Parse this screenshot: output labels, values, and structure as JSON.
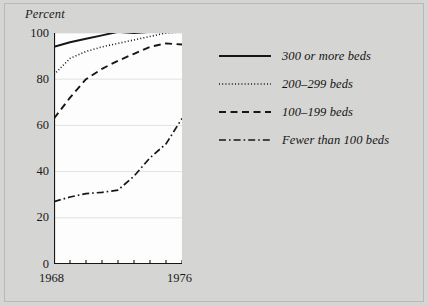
{
  "chart_data": {
    "type": "line",
    "title": "",
    "xlabel": "",
    "ylabel": "Percent",
    "xlim": [
      1968,
      1976
    ],
    "ylim": [
      0,
      100
    ],
    "grid": true,
    "legend_position": "right",
    "x": [
      1968,
      1969,
      1970,
      1971,
      1972,
      1973,
      1974,
      1975,
      1976
    ],
    "xtick_labels": [
      "1968",
      "1976"
    ],
    "ytick_labels": [
      "0",
      "20",
      "40",
      "60",
      "80",
      "100"
    ],
    "yticks": [
      0,
      20,
      40,
      60,
      80,
      100
    ],
    "series": [
      {
        "name": "300 or more beds",
        "style": "solid",
        "values": [
          94,
          96,
          97.5,
          99,
          100.5,
          100,
          100.5,
          101,
          101
        ]
      },
      {
        "name": "200-299 beds",
        "style": "dotted",
        "values": [
          82,
          89,
          92,
          94,
          95.5,
          97,
          98.5,
          100,
          100.5
        ]
      },
      {
        "name": "100-199 beds",
        "style": "dashed",
        "values": [
          63,
          72,
          80,
          84.5,
          88,
          91,
          94,
          95.5,
          95
        ]
      },
      {
        "name": "Fewer than 100 beds",
        "style": "dash-dot",
        "values": [
          27,
          29,
          30.5,
          31,
          32,
          38,
          46,
          52,
          63
        ]
      }
    ],
    "colors": {
      "line": "#161616",
      "grid": "#e2e2e2",
      "plot_background": "#fdfdfd",
      "figure_background": "#d5d5d4",
      "text": "#1a1a1a"
    }
  },
  "legend": {
    "items": [
      {
        "label": "300 or more beds",
        "swatch": "solid-line-swatch"
      },
      {
        "label": "200–299 beds",
        "swatch": "dotted-line-swatch"
      },
      {
        "label": "100–199 beds",
        "swatch": "dashed-line-swatch"
      },
      {
        "label": "Fewer than 100 beds",
        "swatch": "dash-dot-line-swatch"
      }
    ]
  }
}
